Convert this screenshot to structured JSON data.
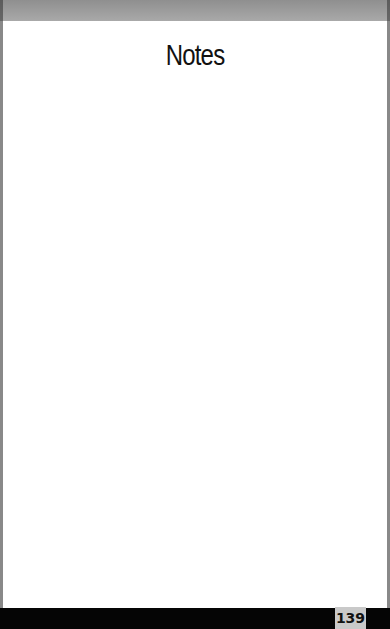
{
  "page": {
    "title": "Notes",
    "page_number": "139"
  },
  "colors": {
    "top_band": "#9a9a9a",
    "background": "#ffffff",
    "bottom_bar": "#050505",
    "page_number_box": "#c9c9c9"
  }
}
